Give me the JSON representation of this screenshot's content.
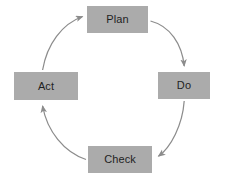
{
  "diagram": {
    "type": "cycle-diagram",
    "direction": "clockwise",
    "background_color": "#ffffff",
    "node_fill_color": "#ababab",
    "node_text_color": "#1f1f1f",
    "arrow_color": "#8c8c8c",
    "nodes": [
      {
        "id": "plan",
        "label": "Plan",
        "position": "top"
      },
      {
        "id": "do",
        "label": "Do",
        "position": "right"
      },
      {
        "id": "check",
        "label": "Check",
        "position": "bottom"
      },
      {
        "id": "act",
        "label": "Act",
        "position": "left"
      }
    ],
    "arrows": [
      {
        "id": "plan-to-do",
        "from": "Plan",
        "to": "Do"
      },
      {
        "id": "do-to-check",
        "from": "Do",
        "to": "Check"
      },
      {
        "id": "check-to-act",
        "from": "Check",
        "to": "Act"
      },
      {
        "id": "act-to-plan",
        "from": "Act",
        "to": "Plan"
      }
    ]
  }
}
